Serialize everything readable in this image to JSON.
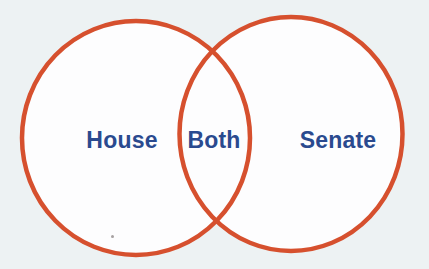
{
  "venn": {
    "left_label": "House",
    "overlap_label": "Both",
    "right_label": "Senate"
  },
  "colors": {
    "circle_stroke": "#d6502e",
    "circle_fill": "#fdfdfe",
    "label_text": "#2a4a8f",
    "background": "#edf2f3"
  }
}
